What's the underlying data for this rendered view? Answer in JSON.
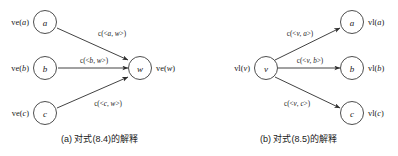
{
  "figure": {
    "width": 398,
    "height": 156,
    "background": "#ffffff",
    "stroke_color": "#2d2d2d",
    "text_color": "#1a1a1a"
  },
  "panels": [
    {
      "id": "a",
      "caption": "(a) 对式(8.4)的解释",
      "direction": "converging",
      "center_node": {
        "letter": "w",
        "outer_label_prefix": "ve(",
        "outer_label_arg": "w",
        "outer_label_suffix": ")",
        "outer_label": "ve(w)",
        "side": "right"
      },
      "leaf_nodes": [
        {
          "letter": "a",
          "outer_label": "ve(a)",
          "outer_label_prefix": "ve(",
          "outer_label_arg": "a",
          "outer_label_suffix": ")",
          "side": "left"
        },
        {
          "letter": "b",
          "outer_label": "ve(b)",
          "outer_label_prefix": "ve(",
          "outer_label_arg": "b",
          "outer_label_suffix": ")",
          "side": "left"
        },
        {
          "letter": "c",
          "outer_label": "ve(c)",
          "outer_label_prefix": "ve(",
          "outer_label_arg": "c",
          "outer_label_suffix": ")",
          "side": "left"
        }
      ],
      "edges": [
        {
          "from": "a",
          "to": "w",
          "label": "c(<a, w>)",
          "label_head": "c(<",
          "label_arg1": "a",
          "label_mid": ", ",
          "label_arg2": "w",
          "label_tail": ">)"
        },
        {
          "from": "b",
          "to": "w",
          "label": "c(<b, w>)",
          "label_head": "c(<",
          "label_arg1": "b",
          "label_mid": ", ",
          "label_arg2": "w",
          "label_tail": ">)"
        },
        {
          "from": "c",
          "to": "w",
          "label": "c(<c, w>)",
          "label_head": "c(<",
          "label_arg1": "c",
          "label_mid": ", ",
          "label_arg2": "w",
          "label_tail": ">)"
        }
      ]
    },
    {
      "id": "b",
      "caption": "(b) 对式(8.5)的解释",
      "direction": "diverging",
      "center_node": {
        "letter": "v",
        "outer_label_prefix": "vl(",
        "outer_label_arg": "v",
        "outer_label_suffix": ")",
        "outer_label": "vl(v)",
        "side": "left"
      },
      "leaf_nodes": [
        {
          "letter": "a",
          "outer_label": "vl(a)",
          "outer_label_prefix": "vl(",
          "outer_label_arg": "a",
          "outer_label_suffix": ")",
          "side": "right"
        },
        {
          "letter": "b",
          "outer_label": "vl(b)",
          "outer_label_prefix": "vl(",
          "outer_label_arg": "b",
          "outer_label_suffix": ")",
          "side": "right"
        },
        {
          "letter": "c",
          "outer_label": "vl(c)",
          "outer_label_prefix": "vl(",
          "outer_label_arg": "c",
          "outer_label_suffix": ")",
          "side": "right"
        }
      ],
      "edges": [
        {
          "from": "v",
          "to": "a",
          "label": "c(<v, a>)",
          "label_head": "c(<",
          "label_arg1": "v",
          "label_mid": ", ",
          "label_arg2": "a",
          "label_tail": ">)"
        },
        {
          "from": "v",
          "to": "b",
          "label": "c(<v, b>)",
          "label_head": "c(<",
          "label_arg1": "v",
          "label_mid": ", ",
          "label_arg2": "b",
          "label_tail": ">)"
        },
        {
          "from": "v",
          "to": "c",
          "label": "c(<v, c>)",
          "label_head": "c(<",
          "label_arg1": "v",
          "label_mid": ", ",
          "label_arg2": "c",
          "label_tail": ">)"
        }
      ]
    }
  ]
}
